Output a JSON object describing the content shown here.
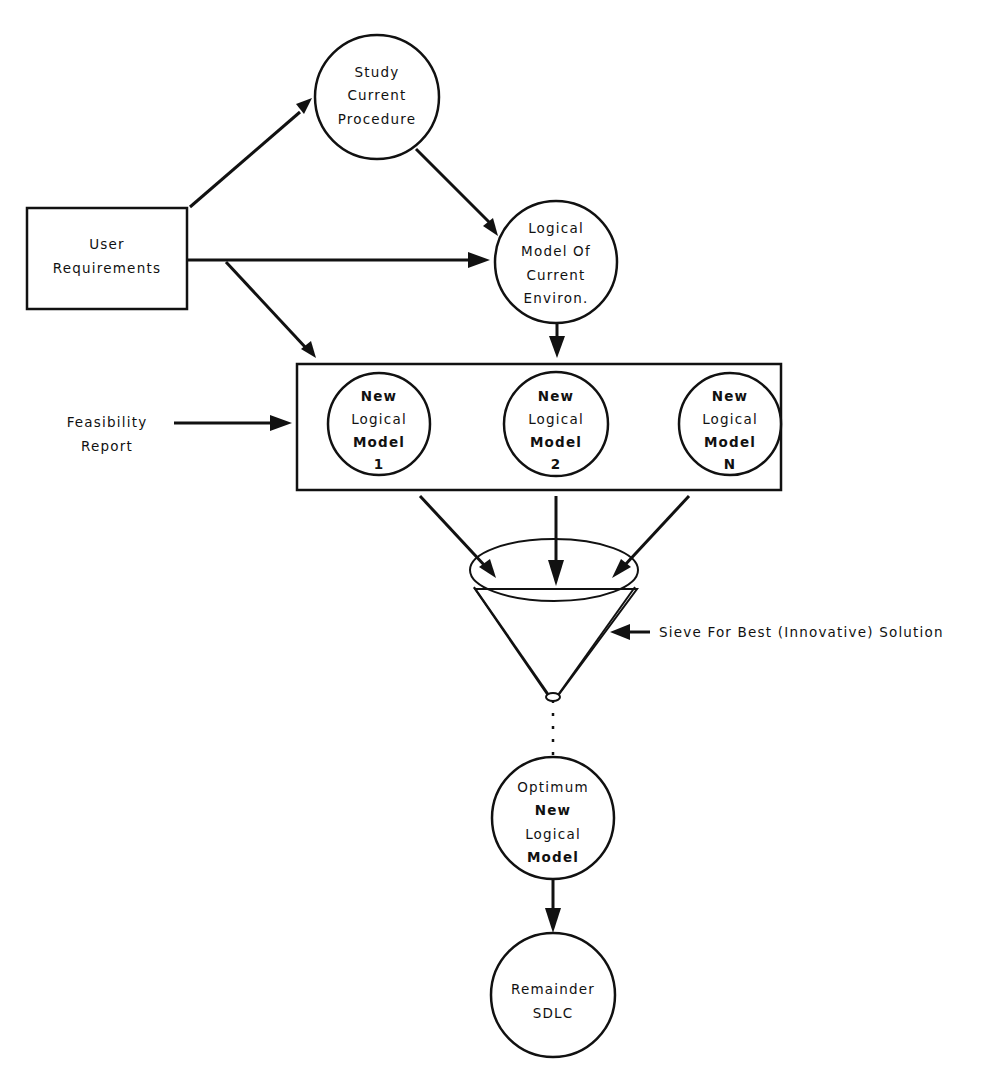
{
  "diagram": {
    "type": "flowchart",
    "colors": {
      "ink": "#111111",
      "background": "#ffffff"
    },
    "nodes": {
      "user_requirements": {
        "shape": "rectangle",
        "lines": [
          "User",
          "Requirements"
        ]
      },
      "study_current_procedure": {
        "shape": "circle",
        "lines": [
          "Study",
          "Current",
          "Procedure"
        ]
      },
      "logical_model_current": {
        "shape": "circle",
        "lines": [
          "Logical",
          "Model Of",
          "Current",
          "Environ."
        ]
      },
      "feasibility_report": {
        "shape": "label",
        "lines": [
          "Feasibility",
          "Report"
        ]
      },
      "new_model_1": {
        "shape": "circle",
        "lines": [
          "New",
          "Logical",
          "Model",
          "1"
        ]
      },
      "new_model_2": {
        "shape": "circle",
        "lines": [
          "New",
          "Logical",
          "Model",
          "2"
        ]
      },
      "new_model_n": {
        "shape": "circle",
        "lines": [
          "New",
          "Logical",
          "Model",
          "N"
        ]
      },
      "sieve": {
        "shape": "funnel",
        "label": "Sieve For Best (Innovative) Solution"
      },
      "optimum_model": {
        "shape": "circle",
        "lines": [
          "Optimum",
          "New",
          "Logical",
          "Model"
        ]
      },
      "remainder_sdlc": {
        "shape": "circle",
        "lines": [
          "Remainder",
          "SDLC"
        ]
      }
    },
    "edges": [
      {
        "from": "user_requirements",
        "to": "study_current_procedure"
      },
      {
        "from": "user_requirements",
        "to": "logical_model_current"
      },
      {
        "from": "user_requirements",
        "to": "new_models_group"
      },
      {
        "from": "study_current_procedure",
        "to": "logical_model_current"
      },
      {
        "from": "logical_model_current",
        "to": "new_models_group"
      },
      {
        "from": "feasibility_report",
        "to": "new_models_group"
      },
      {
        "from": "new_model_1",
        "to": "sieve"
      },
      {
        "from": "new_model_2",
        "to": "sieve"
      },
      {
        "from": "new_model_n",
        "to": "sieve"
      },
      {
        "from": "sieve",
        "to": "optimum_model",
        "style": "dotted"
      },
      {
        "from": "optimum_model",
        "to": "remainder_sdlc"
      }
    ]
  }
}
